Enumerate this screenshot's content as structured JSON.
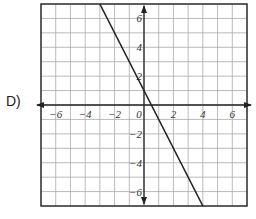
{
  "option_label": "D)",
  "graph": {
    "x_range": [
      -7,
      7
    ],
    "y_range": [
      -7,
      7
    ],
    "x_ticks": [
      "-6",
      "-4",
      "-2",
      "0",
      "2",
      "4",
      "6"
    ],
    "y_ticks": [
      "6",
      "4",
      "2",
      "-2",
      "-4",
      "-6"
    ],
    "line": {
      "slope": -2,
      "intercept": 1,
      "from": [
        -3,
        7
      ],
      "to": [
        4,
        -7
      ]
    },
    "colors": {
      "grid": "#aaaaaa",
      "axis": "#222222",
      "line": "#222222",
      "frame": "#333333"
    }
  }
}
